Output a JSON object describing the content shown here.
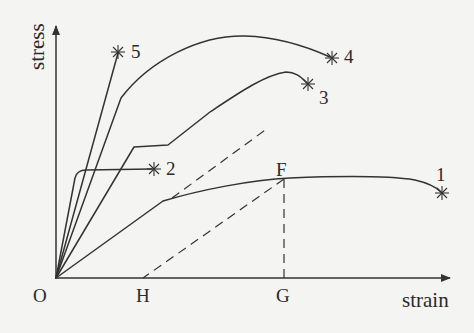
{
  "axes": {
    "y_label": "stress",
    "x_label": "strain",
    "origin_label": "O"
  },
  "points": {
    "H": "H",
    "G": "G",
    "F": "F"
  },
  "curves": [
    {
      "id": "1",
      "label": "1",
      "description": "ductile material with long plastic region, fracture at far right"
    },
    {
      "id": "2",
      "label": "2",
      "description": "steep elastic rise then flat plateau, fracture early"
    },
    {
      "id": "3",
      "label": "3",
      "description": "elastic, yield step, then hardening to peak, fracture"
    },
    {
      "id": "4",
      "label": "4",
      "description": "stiff elastic, then large rounded curve to highest stress, fracture"
    },
    {
      "id": "5",
      "label": "5",
      "description": "brittle, straight line to fracture"
    }
  ],
  "colors": {
    "background": "#f4f4f2",
    "ink": "#333333"
  }
}
